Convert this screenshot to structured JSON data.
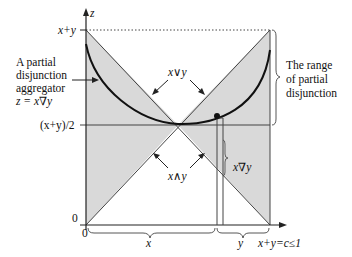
{
  "diagram": {
    "axis_labels": {
      "z": "z",
      "top": "x+y",
      "middle": "(x+y)/2",
      "zero_y": "0",
      "zero_x": "0",
      "x_segment": "x",
      "y_segment": "y",
      "right_end": "x+y=c≤1"
    },
    "region_labels": {
      "upper": "x∨y",
      "lower": "x∧y",
      "point": "x∇y"
    },
    "annotations": {
      "left_line1": "A partial",
      "left_line2": "disjunction",
      "left_line3": "aggregator",
      "left_line4": "z = x∇y",
      "right_line1": "The range",
      "right_line2": "of partial",
      "right_line3": "disjunction"
    },
    "colors": {
      "shade": "#d9d9d9",
      "line": "#333333",
      "curve": "#111111"
    }
  }
}
